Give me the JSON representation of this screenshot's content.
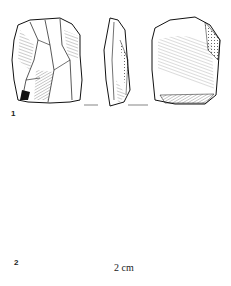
{
  "figure": {
    "artifacts": [
      {
        "number": "1",
        "views": [
          "dorsal-view",
          "lateral-view",
          "ventral-view"
        ]
      },
      {
        "number": "2",
        "views": [
          "dorsal-view",
          "lateral-view",
          "ventral-view"
        ]
      }
    ],
    "scale_bar": {
      "label": "2 cm"
    }
  },
  "colors": {
    "ink": "#1a1a1a",
    "paper": "#ffffff"
  }
}
